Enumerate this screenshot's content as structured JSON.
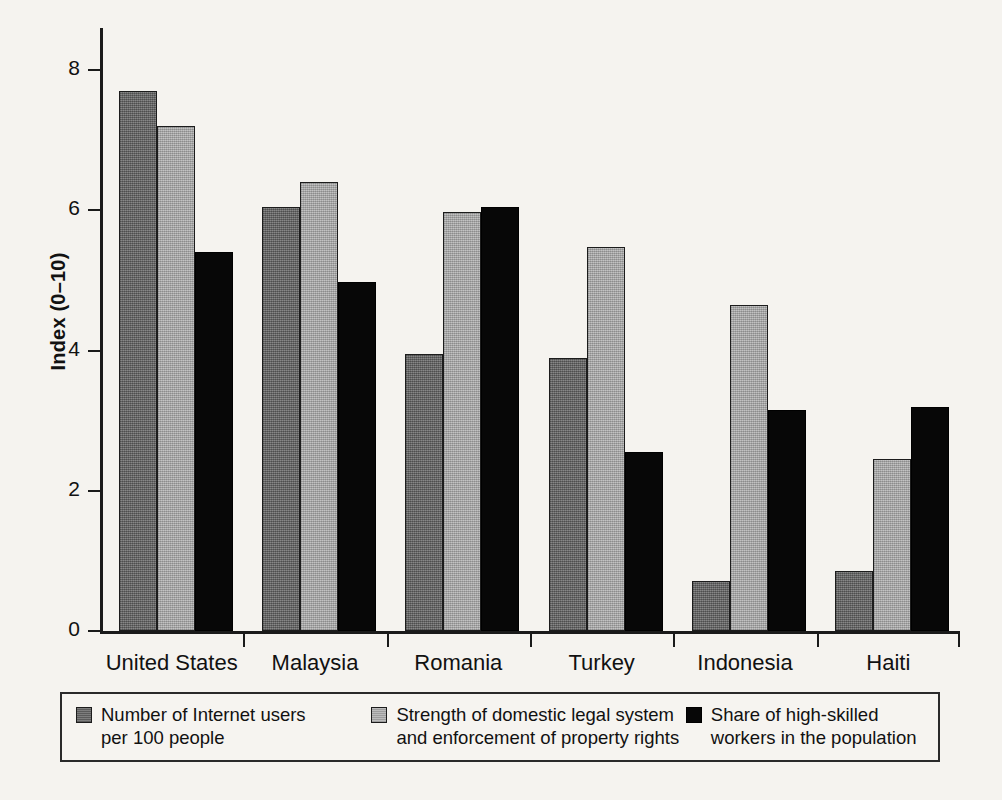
{
  "chart_data": {
    "type": "bar",
    "title": "",
    "subtitle": "",
    "xlabel": "",
    "ylabel": "Index (0–10)",
    "ylim": [
      0,
      8.6
    ],
    "yticks": [
      0,
      2,
      4,
      6,
      8
    ],
    "ytick_labels": [
      "0",
      "2",
      "4",
      "6",
      "8"
    ],
    "grid": false,
    "legend_position": "bottom",
    "categories": [
      "United States",
      "Malaysia",
      "Romania",
      "Turkey",
      "Indonesia",
      "Haiti"
    ],
    "series": [
      {
        "name": "Number of Internet users per 100 people",
        "legend_label": "Number of Internet users\nper 100 people",
        "color": "#6f6f6f",
        "values": [
          7.7,
          6.05,
          3.95,
          3.9,
          0.72,
          0.85
        ]
      },
      {
        "name": "Strength of domestic legal system and enforcement of property rights",
        "legend_label": "Strength of domestic legal system\nand enforcement of property rights",
        "color": "#b3b3b3",
        "values": [
          7.2,
          6.4,
          5.98,
          5.47,
          4.65,
          2.45
        ]
      },
      {
        "name": "Share of high-skilled workers in the population",
        "legend_label": "Share of high-skilled\nworkers in the population",
        "color": "#070707",
        "values": [
          5.4,
          4.98,
          6.05,
          2.55,
          3.15,
          3.2
        ]
      }
    ]
  },
  "axis": {
    "y_title": "Index (0–10)"
  },
  "legend": {
    "entries": [
      "Number of Internet users\nper 100 people",
      "Strength of domestic legal system\nand enforcement of property rights",
      "Share of high-skilled\nworkers in the population"
    ]
  }
}
